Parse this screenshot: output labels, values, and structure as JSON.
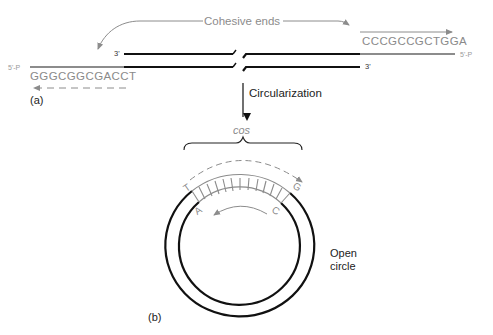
{
  "diagram": {
    "title_annotation": "Cohesive ends",
    "panel_a": {
      "label": "(a)",
      "left_end": {
        "five_prime_label": "5'-P",
        "three_prime_label": "3'",
        "sequence": "GGGCGGCGACCT"
      },
      "right_end": {
        "five_prime_label": "5'-P",
        "three_prime_label": "3'",
        "sequence": "CCCGCCGCTGGA"
      }
    },
    "step_label": "Circularization",
    "panel_b": {
      "label": "(b)",
      "site_label": "cos",
      "corner_letters": {
        "outer_left": "T",
        "outer_right": "G",
        "inner_left": "A",
        "inner_right": "C"
      },
      "circle_label_line1": "Open",
      "circle_label_line2": "circle",
      "box_cells": 12
    },
    "colors": {
      "dna_strand": "#111111",
      "cohesive_end": "#8c8c8c",
      "annotation": "#8c8c8c"
    }
  }
}
